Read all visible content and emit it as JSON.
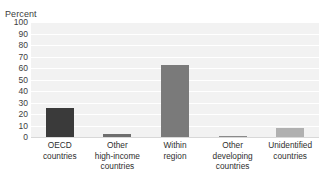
{
  "chart_data": {
    "type": "bar",
    "title": "",
    "xlabel": "",
    "ylabel": "Percent",
    "ylim": [
      0,
      100
    ],
    "ytick_step": 10,
    "yticks": [
      "100",
      "90",
      "80",
      "70",
      "60",
      "50",
      "40",
      "30",
      "20",
      "10",
      "0"
    ],
    "grid": true,
    "legend": "none",
    "categories": [
      "OECD countries",
      "Other high-income countries",
      "Within region",
      "Other developing countries",
      "Unidentified countries"
    ],
    "category_lines": [
      [
        "OECD",
        "countries"
      ],
      [
        "Other",
        "high-income",
        "countries"
      ],
      [
        "Within",
        "region"
      ],
      [
        "Other",
        "developing",
        "countries"
      ],
      [
        "Unidentified",
        "countries"
      ]
    ],
    "values": [
      25,
      3,
      63,
      1,
      8
    ],
    "bar_colors": [
      "#3a3a3a",
      "#6e6e6e",
      "#7a7a7a",
      "#8a8a8a",
      "#b0b0b0"
    ]
  },
  "style": {
    "plot_background": "#f2f2f2",
    "gridline_color": "#ffffff",
    "page_background": "#ffffff",
    "text_color": "#2e2e2e"
  }
}
